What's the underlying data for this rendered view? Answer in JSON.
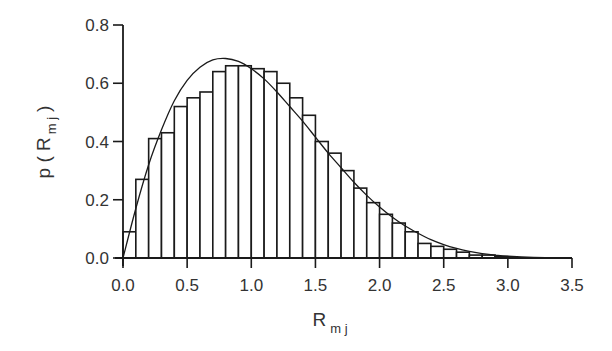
{
  "chart_data": {
    "type": "bar",
    "title": "",
    "xlabel": "R_mj",
    "ylabel": "p(R_mj)",
    "xlabel_main": "R",
    "xlabel_sub": "m j",
    "ylabel_parts": [
      "p",
      "(",
      "R",
      "m j",
      ")"
    ],
    "xlim": [
      0.0,
      3.5
    ],
    "ylim": [
      0.0,
      0.8
    ],
    "x_ticks": [
      "0.0",
      "0.5",
      "1.0",
      "1.5",
      "2.0",
      "2.5",
      "3.0",
      "3.5"
    ],
    "y_ticks": [
      "0.0",
      "0.2",
      "0.4",
      "0.6",
      "0.8"
    ],
    "grid": false,
    "legend": null,
    "bin_width": 0.1,
    "series": [
      {
        "name": "histogram",
        "type": "bar",
        "bin_starts": [
          0.0,
          0.1,
          0.2,
          0.3,
          0.4,
          0.5,
          0.6,
          0.7,
          0.8,
          0.9,
          1.0,
          1.1,
          1.2,
          1.3,
          1.4,
          1.5,
          1.6,
          1.7,
          1.8,
          1.9,
          2.0,
          2.1,
          2.2,
          2.3,
          2.4,
          2.5,
          2.6,
          2.7,
          2.8,
          2.9
        ],
        "values": [
          0.09,
          0.27,
          0.41,
          0.43,
          0.52,
          0.55,
          0.57,
          0.64,
          0.66,
          0.66,
          0.65,
          0.64,
          0.6,
          0.55,
          0.49,
          0.4,
          0.36,
          0.3,
          0.24,
          0.19,
          0.15,
          0.12,
          0.09,
          0.05,
          0.04,
          0.03,
          0.02,
          0.01,
          0.01,
          0.005
        ]
      },
      {
        "name": "fitted curve",
        "type": "line",
        "x": [
          0.0,
          0.1,
          0.2,
          0.3,
          0.4,
          0.5,
          0.6,
          0.7,
          0.8,
          0.9,
          1.0,
          1.1,
          1.2,
          1.3,
          1.4,
          1.5,
          1.6,
          1.7,
          1.8,
          1.9,
          2.0,
          2.1,
          2.2,
          2.3,
          2.4,
          2.5,
          2.6,
          2.7,
          2.8,
          2.9,
          3.0,
          3.2,
          3.5
        ],
        "values": [
          0.0,
          0.17,
          0.32,
          0.44,
          0.54,
          0.61,
          0.655,
          0.68,
          0.685,
          0.675,
          0.65,
          0.615,
          0.57,
          0.52,
          0.47,
          0.415,
          0.36,
          0.31,
          0.26,
          0.215,
          0.175,
          0.14,
          0.11,
          0.085,
          0.063,
          0.046,
          0.033,
          0.023,
          0.015,
          0.01,
          0.006,
          0.002,
          0.0
        ]
      }
    ]
  }
}
